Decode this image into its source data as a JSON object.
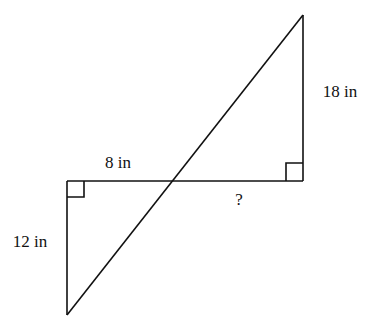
{
  "diagram": {
    "type": "geometry",
    "labels": {
      "top_segment": "8 in",
      "left_side": "12 in",
      "right_side": "18 in",
      "unknown": "?"
    },
    "colors": {
      "stroke": "#111111",
      "background": "#ffffff"
    }
  }
}
